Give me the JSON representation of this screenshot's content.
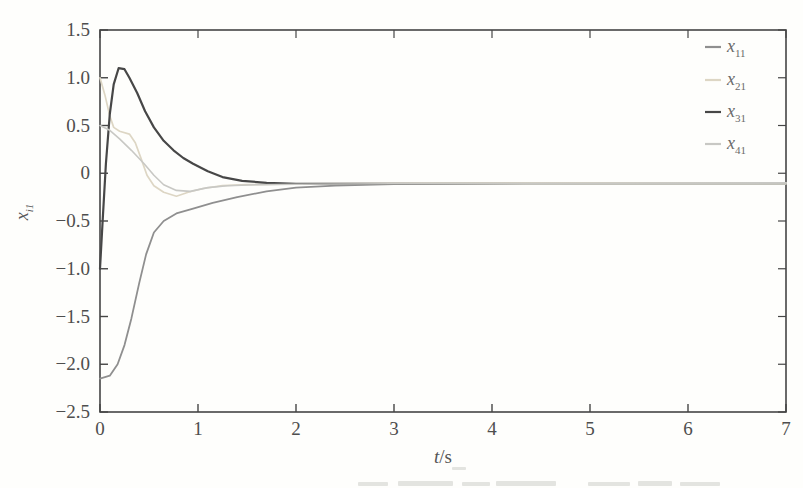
{
  "figure": {
    "xlabel_symbol": "t",
    "xlabel_unit": "/s",
    "ylabel_symbol": "x",
    "ylabel_subscript": "i1"
  },
  "chart_data": {
    "type": "line",
    "title": "",
    "xlabel": "t/s",
    "ylabel": "x_i1",
    "xlim": [
      0,
      7
    ],
    "ylim": [
      -2.5,
      1.5
    ],
    "grid": "off",
    "box": "on",
    "legend_position": "inside top-right, no frame, vertical",
    "x_ticks": [
      0,
      1,
      2,
      3,
      4,
      5,
      6,
      7
    ],
    "x_tick_labels": [
      "0",
      "1",
      "2",
      "3",
      "4",
      "5",
      "6",
      "7"
    ],
    "y_ticks": [
      1.5,
      1.0,
      0.5,
      0,
      -0.5,
      -1.0,
      -1.5,
      -2.0,
      -2.5
    ],
    "y_tick_labels": [
      "1.5",
      "1.0",
      "0.5",
      "0",
      "−0.5",
      "−1.0",
      "−1.5",
      "−2.0",
      "−2.5"
    ],
    "axis_color": "#454545",
    "tick_label_color": "#4e4e4e",
    "series": [
      {
        "name": "x11",
        "label_base": "x",
        "label_sub": "11",
        "color": "#8f8f8f",
        "fade_to": "#c0c0b8",
        "width": 1.8,
        "points": [
          [
            0,
            -2.15
          ],
          [
            0.1,
            -2.12
          ],
          [
            0.18,
            -2.0
          ],
          [
            0.25,
            -1.8
          ],
          [
            0.32,
            -1.52
          ],
          [
            0.4,
            -1.15
          ],
          [
            0.47,
            -0.85
          ],
          [
            0.55,
            -0.62
          ],
          [
            0.65,
            -0.5
          ],
          [
            0.78,
            -0.42
          ],
          [
            0.95,
            -0.37
          ],
          [
            1.15,
            -0.31
          ],
          [
            1.4,
            -0.25
          ],
          [
            1.7,
            -0.19
          ],
          [
            2.0,
            -0.15
          ],
          [
            2.4,
            -0.13
          ],
          [
            3.0,
            -0.115
          ],
          [
            4.0,
            -0.105
          ],
          [
            5.0,
            -0.1
          ],
          [
            6.0,
            -0.1
          ],
          [
            7.0,
            -0.1
          ]
        ]
      },
      {
        "name": "x21",
        "label_base": "x",
        "label_sub": "21",
        "color": "#ddd6c4",
        "fade_to": "#ddd6c4",
        "width": 1.7,
        "points": [
          [
            0,
            1.0
          ],
          [
            0.05,
            0.82
          ],
          [
            0.1,
            0.6
          ],
          [
            0.14,
            0.48
          ],
          [
            0.2,
            0.44
          ],
          [
            0.3,
            0.41
          ],
          [
            0.36,
            0.32
          ],
          [
            0.42,
            0.15
          ],
          [
            0.48,
            -0.02
          ],
          [
            0.55,
            -0.13
          ],
          [
            0.65,
            -0.2
          ],
          [
            0.78,
            -0.24
          ],
          [
            0.9,
            -0.2
          ],
          [
            1.05,
            -0.16
          ],
          [
            1.25,
            -0.13
          ],
          [
            1.5,
            -0.12
          ],
          [
            2.0,
            -0.11
          ],
          [
            3.0,
            -0.105
          ],
          [
            5.0,
            -0.1
          ],
          [
            7.0,
            -0.1
          ]
        ]
      },
      {
        "name": "x31",
        "label_base": "x",
        "label_sub": "31",
        "color": "#474747",
        "fade_to": "#c2c2ba",
        "width": 2.2,
        "points": [
          [
            0,
            -1.0
          ],
          [
            0.03,
            -0.45
          ],
          [
            0.06,
            0.1
          ],
          [
            0.1,
            0.62
          ],
          [
            0.14,
            0.93
          ],
          [
            0.19,
            1.1
          ],
          [
            0.25,
            1.09
          ],
          [
            0.3,
            1.0
          ],
          [
            0.38,
            0.84
          ],
          [
            0.46,
            0.65
          ],
          [
            0.55,
            0.48
          ],
          [
            0.65,
            0.34
          ],
          [
            0.75,
            0.24
          ],
          [
            0.85,
            0.16
          ],
          [
            0.95,
            0.1
          ],
          [
            1.1,
            0.02
          ],
          [
            1.25,
            -0.04
          ],
          [
            1.45,
            -0.08
          ],
          [
            1.7,
            -0.1
          ],
          [
            2.0,
            -0.11
          ],
          [
            2.5,
            -0.11
          ],
          [
            3.5,
            -0.11
          ],
          [
            5.0,
            -0.11
          ],
          [
            7.0,
            -0.11
          ]
        ]
      },
      {
        "name": "x41",
        "label_base": "x",
        "label_sub": "41",
        "color": "#c8c8c4",
        "fade_to": "#c8c8c4",
        "width": 1.6,
        "points": [
          [
            0,
            0.5
          ],
          [
            0.1,
            0.45
          ],
          [
            0.2,
            0.36
          ],
          [
            0.32,
            0.24
          ],
          [
            0.45,
            0.1
          ],
          [
            0.55,
            -0.02
          ],
          [
            0.65,
            -0.12
          ],
          [
            0.78,
            -0.18
          ],
          [
            0.92,
            -0.19
          ],
          [
            1.1,
            -0.15
          ],
          [
            1.3,
            -0.13
          ],
          [
            1.6,
            -0.12
          ],
          [
            2.0,
            -0.115
          ],
          [
            3.0,
            -0.11
          ],
          [
            5.0,
            -0.105
          ],
          [
            7.0,
            -0.1
          ]
        ]
      }
    ]
  }
}
